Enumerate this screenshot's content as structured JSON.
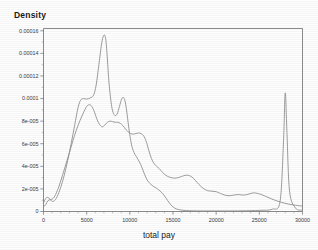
{
  "chart_data": {
    "type": "line",
    "title": "",
    "xlabel": "total pay",
    "ylabel": "Density",
    "xlim": [
      0,
      30000
    ],
    "ylim": [
      0,
      0.000162
    ],
    "grid": false,
    "legend": "none",
    "xticks": [
      0,
      5000,
      10000,
      15000,
      20000,
      25000,
      30000
    ],
    "xticklabels": [
      "0",
      "5000",
      "10000",
      "15000",
      "20000",
      "25000",
      "30000"
    ],
    "yticks": [
      0,
      2e-05,
      4e-05,
      6e-05,
      8e-05,
      0.0001,
      0.00012,
      0.00014,
      0.00016
    ],
    "yticklabels": [
      "0",
      "2e-005",
      "4e-005",
      "6e-005",
      "8e-005",
      "0.0001",
      "0.00012",
      "0.00014",
      "0.00016"
    ],
    "series": [
      {
        "name": "curve-a",
        "x": [
          0,
          250,
          500,
          750,
          1000,
          1300,
          1600,
          2000,
          2400,
          2800,
          3200,
          3600,
          4000,
          4300,
          4600,
          5000,
          5400,
          5800,
          6100,
          6400,
          6700,
          6900,
          7100,
          7250,
          7400,
          7600,
          7900,
          8200,
          8500,
          8800,
          9000,
          9200,
          9400,
          9600,
          9900,
          10200,
          10500,
          10800,
          11100,
          11400,
          11700,
          12000,
          12300,
          12600,
          12900,
          13200,
          13600,
          14000,
          14400,
          14800,
          15200,
          15600,
          16000,
          16600,
          17400,
          18400,
          19500,
          21000,
          23000,
          25000,
          26500,
          27400,
          27800,
          28000,
          28200,
          28500,
          29200,
          30000
        ],
        "y": [
          7.5e-06,
          1.15e-05,
          1.25e-05,
          1.1e-05,
          9e-06,
          9.8e-06,
          1.35e-05,
          2.15e-05,
          3.2e-05,
          4.5e-05,
          6e-05,
          7.6e-05,
          9.2e-05,
          9.85e-05,
          0.0001,
          9.95e-05,
          0.0001005,
          0.000103,
          0.000112,
          0.000129,
          0.000147,
          0.0001545,
          0.000156,
          0.00015,
          0.000135,
          0.000113,
          9.3e-05,
          8.55e-05,
          8.6e-05,
          9.3e-05,
          9.85e-05,
          0.000101,
          9.9e-05,
          9.1e-05,
          7.3e-05,
          5.9e-05,
          5.2e-05,
          4.8e-05,
          4.4e-05,
          3.9e-05,
          3.3e-05,
          2.8e-05,
          2.5e-05,
          2.3e-05,
          2.15e-05,
          2e-05,
          1.75e-05,
          1.4e-05,
          9.5e-06,
          5.5e-06,
          3e-06,
          1.8e-06,
          1.2e-06,
          8e-07,
          6e-07,
          5e-07,
          5e-07,
          5e-07,
          6e-07,
          1e-06,
          2e-06,
          9e-06,
          6.2e-05,
          0.000105,
          7e-05,
          1.8e-05,
          3e-06,
          1.2e-06
        ]
      },
      {
        "name": "curve-b",
        "x": [
          0,
          250,
          500,
          800,
          1100,
          1400,
          1800,
          2200,
          2600,
          3000,
          3400,
          3800,
          4200,
          4600,
          5000,
          5300,
          5600,
          5900,
          6200,
          6500,
          6800,
          7100,
          7400,
          7700,
          8000,
          8300,
          8600,
          8900,
          9200,
          9500,
          9800,
          10100,
          10400,
          10700,
          11000,
          11300,
          11600,
          11900,
          12200,
          12500,
          12800,
          13100,
          13400,
          13700,
          14000,
          14400,
          14800,
          15200,
          15600,
          16000,
          16400,
          16800,
          17200,
          17600,
          18000,
          18500,
          19000,
          19500,
          20000,
          20500,
          21000,
          21500,
          22000,
          22600,
          23200,
          23800,
          24300,
          24800,
          25400,
          26000,
          26800,
          27600,
          28400,
          29200,
          30000
        ],
        "y": [
          4e-06,
          6e-06,
          9.5e-06,
          1.05e-05,
          1.15e-05,
          1.5e-05,
          2.25e-05,
          3.2e-05,
          4.2e-05,
          5.2e-05,
          6.25e-05,
          7.2e-05,
          8e-05,
          8.7e-05,
          9.3e-05,
          9.45e-05,
          9.3e-05,
          8.8e-05,
          8.15e-05,
          7.7e-05,
          7.5e-05,
          7.65e-05,
          7.9e-05,
          8e-05,
          7.95e-05,
          7.9e-05,
          7.9e-05,
          7.8e-05,
          7.6e-05,
          7.3e-05,
          7.05e-05,
          6.9e-05,
          6.85e-05,
          6.9e-05,
          6.95e-05,
          6.9e-05,
          6.7e-05,
          6.2e-05,
          5.4e-05,
          4.7e-05,
          4.25e-05,
          4e-05,
          3.8e-05,
          3.55e-05,
          3.3e-05,
          3.1e-05,
          3e-05,
          2.95e-05,
          3e-05,
          3.1e-05,
          3.2e-05,
          3.2e-05,
          3.05e-05,
          2.75e-05,
          2.4e-05,
          2.05e-05,
          1.85e-05,
          1.8e-05,
          1.75e-05,
          1.6e-05,
          1.45e-05,
          1.4e-05,
          1.45e-05,
          1.5e-05,
          1.45e-05,
          1.55e-05,
          1.65e-05,
          1.6e-05,
          1.45e-05,
          1.25e-05,
          1e-05,
          8e-06,
          6.5e-06,
          5.5e-06,
          4.8e-06
        ]
      }
    ]
  }
}
